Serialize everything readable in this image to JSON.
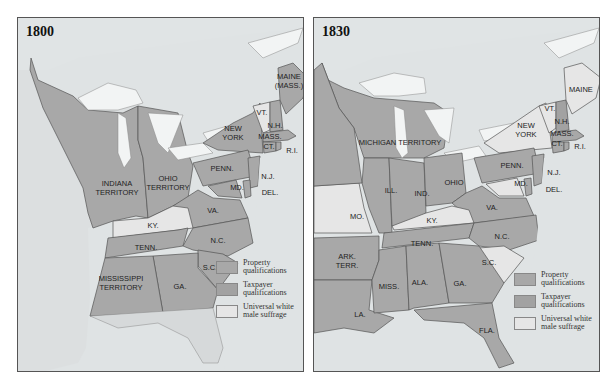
{
  "legend": {
    "items": [
      {
        "key": "property",
        "label_line1": "Property",
        "label_line2": "qualifications",
        "color": "#a8a8a8"
      },
      {
        "key": "taxpayer",
        "label_line1": "Taxpayer",
        "label_line2": "qualifications",
        "color": "#a2a2a2"
      },
      {
        "key": "universal",
        "label_line1": "Universal white",
        "label_line2": "male suffrage",
        "color": "#e6e6e6"
      }
    ]
  },
  "colors": {
    "water": "#dfe3e4",
    "lakes": "#f2f4f4",
    "border": "#555555"
  },
  "classification_note": "Property and taxpayer swatches render as near-identical gray in this grayscale image; only universal (light) vs. restricted (dark) is reliably distinguishable.",
  "maps": [
    {
      "year": "1800",
      "regions": [
        {
          "label": "MAINE (MASS.)",
          "category": "restricted-unclear"
        },
        {
          "label": "VT.",
          "category": "universal"
        },
        {
          "label": "N.H.",
          "category": "restricted-unclear"
        },
        {
          "label": "NEW YORK",
          "category": "restricted-unclear"
        },
        {
          "label": "MASS.",
          "category": "restricted-unclear"
        },
        {
          "label": "CT.",
          "category": "restricted-unclear"
        },
        {
          "label": "R.I.",
          "category": "restricted-unclear"
        },
        {
          "label": "PENN.",
          "category": "restricted-unclear"
        },
        {
          "label": "N.J.",
          "category": "restricted-unclear"
        },
        {
          "label": "MD.",
          "category": "restricted-unclear"
        },
        {
          "label": "DEL.",
          "category": "restricted-unclear"
        },
        {
          "label": "VA.",
          "category": "restricted-unclear"
        },
        {
          "label": "N.C.",
          "category": "restricted-unclear"
        },
        {
          "label": "S.C.",
          "category": "restricted-unclear"
        },
        {
          "label": "GA.",
          "category": "restricted-unclear"
        },
        {
          "label": "KY.",
          "category": "universal"
        },
        {
          "label": "TENN.",
          "category": "restricted-unclear"
        },
        {
          "label": "OHIO TERRITORY",
          "category": "restricted-unclear"
        },
        {
          "label": "INDIANA TERRITORY",
          "category": "restricted-unclear"
        },
        {
          "label": "MISSISSIPPI TERRITORY",
          "category": "restricted-unclear"
        }
      ]
    },
    {
      "year": "1830",
      "regions": [
        {
          "label": "MAINE",
          "category": "universal"
        },
        {
          "label": "VT.",
          "category": "universal"
        },
        {
          "label": "N.H.",
          "category": "restricted-unclear"
        },
        {
          "label": "NEW YORK",
          "category": "universal"
        },
        {
          "label": "MASS.",
          "category": "restricted-unclear"
        },
        {
          "label": "CT.",
          "category": "restricted-unclear"
        },
        {
          "label": "R.I.",
          "category": "restricted-unclear"
        },
        {
          "label": "PENN.",
          "category": "restricted-unclear"
        },
        {
          "label": "N.J.",
          "category": "restricted-unclear"
        },
        {
          "label": "MD.",
          "category": "universal"
        },
        {
          "label": "DEL.",
          "category": "restricted-unclear"
        },
        {
          "label": "VA.",
          "category": "restricted-unclear"
        },
        {
          "label": "N.C.",
          "category": "restricted-unclear"
        },
        {
          "label": "S.C.",
          "category": "universal"
        },
        {
          "label": "GA.",
          "category": "restricted-unclear"
        },
        {
          "label": "KY.",
          "category": "universal"
        },
        {
          "label": "TENN.",
          "category": "restricted-unclear"
        },
        {
          "label": "OHIO",
          "category": "restricted-unclear"
        },
        {
          "label": "IND.",
          "category": "restricted-unclear"
        },
        {
          "label": "ILL.",
          "category": "restricted-unclear"
        },
        {
          "label": "MO.",
          "category": "universal"
        },
        {
          "label": "MICHIGAN TERRITORY",
          "category": "restricted-unclear"
        },
        {
          "label": "ARK. TERR.",
          "category": "restricted-unclear"
        },
        {
          "label": "MISS.",
          "category": "restricted-unclear"
        },
        {
          "label": "ALA.",
          "category": "restricted-unclear"
        },
        {
          "label": "LA.",
          "category": "restricted-unclear"
        },
        {
          "label": "FLA.",
          "category": "restricted-unclear"
        }
      ]
    }
  ],
  "labels_1800": {
    "maine": "MAINE",
    "maine2": "(MASS.)",
    "vt": "VT.",
    "nh": "N.H.",
    "ny1": "NEW",
    "ny2": "YORK",
    "mass": "MASS.",
    "ct": "CT.",
    "ri": "R.I.",
    "penn": "PENN.",
    "nj": "N.J.",
    "md": "MD.",
    "del": "DEL.",
    "va": "VA.",
    "nc": "N.C.",
    "sc": "S.C.",
    "ga": "GA.",
    "ky": "KY.",
    "tenn": "TENN.",
    "ohio1": "OHIO",
    "ohio2": "TERRITORY",
    "ind1": "INDIANA",
    "ind2": "TERRITORY",
    "miss1": "MISSISSIPPI",
    "miss2": "TERRITORY"
  },
  "labels_1830": {
    "maine": "MAINE",
    "vt": "VT.",
    "nh": "N.H.",
    "ny1": "NEW",
    "ny2": "YORK",
    "mass": "MASS.",
    "ct": "CT.",
    "ri": "R.I.",
    "penn": "PENN.",
    "nj": "N.J.",
    "md": "MD.",
    "del": "DEL.",
    "va": "VA.",
    "nc": "N.C.",
    "sc": "S.C.",
    "ga": "GA.",
    "ky": "KY.",
    "tenn": "TENN.",
    "ohio": "OHIO",
    "ind": "IND.",
    "ill": "ILL.",
    "mo": "MO.",
    "mich": "MICHIGAN  TERRITORY",
    "ark1": "ARK.",
    "ark2": "TERR.",
    "miss": "MISS.",
    "ala": "ALA.",
    "la": "LA.",
    "fla": "FLA."
  }
}
